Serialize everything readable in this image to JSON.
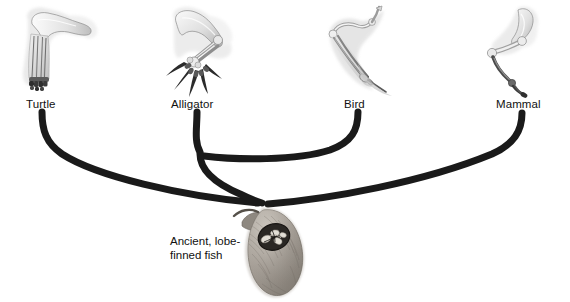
{
  "figure": {
    "type": "cladogram",
    "background_color": "#ffffff",
    "branch_color": "#1a1a1a",
    "text_color": "#111111"
  },
  "taxa": [
    {
      "id": "turtle",
      "label": "Turtle",
      "label_x": 26,
      "label_y": 98,
      "illustration": "turtle-forelimb-skeleton",
      "tip_x": 42,
      "tip_y": 112
    },
    {
      "id": "alligator",
      "label": "Alligator",
      "label_x": 171,
      "label_y": 98,
      "illustration": "alligator-forelimb-skeleton",
      "tip_x": 197,
      "tip_y": 112
    },
    {
      "id": "bird",
      "label": "Bird",
      "label_x": 344,
      "label_y": 98,
      "illustration": "bird-wing-skeleton",
      "tip_x": 358,
      "tip_y": 112
    },
    {
      "id": "mammal",
      "label": "Mammal",
      "label_x": 496,
      "label_y": 98,
      "illustration": "mammal-forelimb-skeleton",
      "tip_x": 522,
      "tip_y": 113
    }
  ],
  "root": {
    "id": "ancient-lobe-finned-fish",
    "label_line1": "Ancient, lobe-",
    "label_line2": "finned fish",
    "label_x": 170,
    "label_y": 236,
    "illustration": "lobe-finned-fish",
    "node_x": 266,
    "node_y": 203
  },
  "nodes": [
    {
      "id": "archosaur-node",
      "x": 200,
      "y": 156
    },
    {
      "id": "root-node",
      "x": 266,
      "y": 203
    }
  ],
  "branches": [
    {
      "id": "branch-turtle",
      "from": "turtle",
      "to": "root-node"
    },
    {
      "id": "branch-alligator",
      "from": "alligator",
      "to": "archosaur-node"
    },
    {
      "id": "branch-bird",
      "from": "bird",
      "to": "archosaur-node"
    },
    {
      "id": "branch-archosaur",
      "from": "archosaur-node",
      "to": "root-node"
    },
    {
      "id": "branch-mammal",
      "from": "mammal",
      "to": "root-node"
    }
  ]
}
